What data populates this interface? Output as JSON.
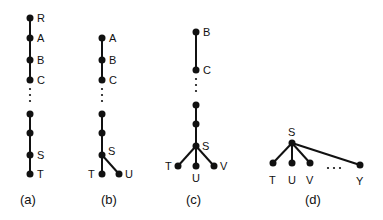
{
  "diagram": {
    "type": "tree-figure",
    "background": "#ffffff",
    "ink": "#111111",
    "panels": [
      {
        "id": "a",
        "caption": "(a)",
        "nodes": [
          {
            "id": "R",
            "label": "R",
            "x": 30,
            "y": 18
          },
          {
            "id": "A",
            "label": "A",
            "x": 30,
            "y": 38
          },
          {
            "id": "B",
            "label": "B",
            "x": 30,
            "y": 60
          },
          {
            "id": "C",
            "label": "C",
            "x": 30,
            "y": 80
          },
          {
            "id": "n1",
            "label": "",
            "x": 30,
            "y": 114
          },
          {
            "id": "n2",
            "label": "",
            "x": 30,
            "y": 133
          },
          {
            "id": "S",
            "label": "S",
            "x": 30,
            "y": 155
          },
          {
            "id": "T",
            "label": "T",
            "x": 30,
            "y": 174
          }
        ],
        "ellipsis": "vertical"
      },
      {
        "id": "b",
        "caption": "(b)",
        "nodes": [
          {
            "id": "A",
            "label": "A",
            "x": 102,
            "y": 38
          },
          {
            "id": "B",
            "label": "B",
            "x": 102,
            "y": 60
          },
          {
            "id": "C",
            "label": "C",
            "x": 102,
            "y": 80
          },
          {
            "id": "n1",
            "label": "",
            "x": 102,
            "y": 114
          },
          {
            "id": "n2",
            "label": "",
            "x": 102,
            "y": 133
          },
          {
            "id": "S",
            "label": "S",
            "x": 102,
            "y": 155
          },
          {
            "id": "T",
            "label": "T",
            "x": 102,
            "y": 174
          },
          {
            "id": "U",
            "label": "U",
            "x": 119,
            "y": 174
          }
        ],
        "ellipsis": "vertical"
      },
      {
        "id": "c",
        "caption": "(c)",
        "nodes": [
          {
            "id": "B",
            "label": "B",
            "x": 196,
            "y": 32
          },
          {
            "id": "C",
            "label": "C",
            "x": 196,
            "y": 70
          },
          {
            "id": "n1",
            "label": "",
            "x": 196,
            "y": 105
          },
          {
            "id": "n2",
            "label": "",
            "x": 196,
            "y": 124
          },
          {
            "id": "S",
            "label": "S",
            "x": 196,
            "y": 146
          },
          {
            "id": "T",
            "label": "T",
            "x": 178,
            "y": 166
          },
          {
            "id": "U",
            "label": "U",
            "x": 196,
            "y": 166
          },
          {
            "id": "V",
            "label": "V",
            "x": 214,
            "y": 166
          }
        ],
        "ellipsis": "vertical"
      },
      {
        "id": "d",
        "caption": "(d)",
        "nodes": [
          {
            "id": "S",
            "label": "S",
            "x": 292,
            "y": 143
          },
          {
            "id": "T",
            "label": "T",
            "x": 273,
            "y": 163
          },
          {
            "id": "U",
            "label": "U",
            "x": 292,
            "y": 163
          },
          {
            "id": "V",
            "label": "V",
            "x": 310,
            "y": 163
          },
          {
            "id": "Y",
            "label": "Y",
            "x": 360,
            "y": 165
          }
        ],
        "ellipsis": "horizontal"
      }
    ]
  }
}
